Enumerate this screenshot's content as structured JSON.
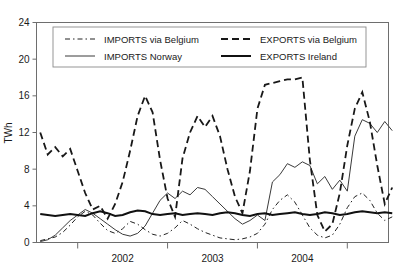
{
  "chart_data": {
    "type": "line",
    "title": "",
    "xlabel": "",
    "ylabel": "TWh",
    "ylim": [
      0,
      24
    ],
    "yticks": [
      0,
      4,
      8,
      12,
      16,
      20,
      24
    ],
    "ytick_labels": [
      "0",
      "4",
      "8",
      "12",
      "16",
      "20",
      "24"
    ],
    "xlim": [
      0,
      47
    ],
    "xtick_positions": [
      5.5,
      17.5,
      29.5,
      41.5
    ],
    "xtick_labels": [
      "2002",
      "2003",
      "2004"
    ],
    "xtick_label_positions": [
      11.5,
      23.5,
      35.5
    ],
    "grid": false,
    "legend_position": "upper-left-inside",
    "series": [
      {
        "name": "IMPORTS via Belgium",
        "style": "dashed-thin",
        "color": "#222222",
        "width": 1.0,
        "dash": "5,3,1.5,3",
        "values": [
          0.2,
          0.4,
          0.6,
          1.1,
          1.9,
          2.8,
          3.4,
          3.0,
          2.1,
          1.3,
          1.0,
          1.5,
          2.3,
          2.0,
          1.4,
          0.9,
          0.7,
          1.0,
          1.6,
          2.4,
          2.0,
          1.5,
          1.1,
          0.8,
          0.5,
          0.4,
          0.3,
          0.4,
          0.6,
          1.0,
          2.0,
          3.6,
          4.6,
          5.2,
          4.4,
          3.0,
          1.6,
          0.8,
          0.5,
          0.8,
          2.0,
          3.8,
          5.0,
          5.4,
          4.6,
          3.2,
          2.4,
          2.8
        ]
      },
      {
        "name": "IMPORTS Norway",
        "style": "solid-thin",
        "color": "#3a3a3a",
        "width": 1.0,
        "dash": "",
        "values": [
          0.1,
          0.3,
          0.8,
          1.6,
          2.4,
          3.0,
          3.6,
          3.2,
          2.6,
          2.0,
          1.4,
          0.9,
          0.7,
          1.0,
          1.8,
          3.2,
          4.6,
          5.4,
          4.8,
          5.6,
          5.2,
          6.0,
          5.8,
          5.0,
          4.2,
          3.4,
          2.6,
          2.0,
          2.4,
          3.0,
          2.4,
          6.6,
          7.4,
          8.6,
          8.2,
          8.8,
          8.4,
          6.4,
          7.2,
          5.8,
          6.8,
          5.6,
          11.6,
          13.4,
          13.0,
          12.0,
          13.2,
          12.2
        ]
      },
      {
        "name": "EXPORTS via Belgium",
        "style": "dashed-thick",
        "color": "#181818",
        "width": 1.8,
        "dash": "7,4",
        "values": [
          12.0,
          9.6,
          10.4,
          9.4,
          10.2,
          7.8,
          5.4,
          3.6,
          4.0,
          2.6,
          4.2,
          6.6,
          10.0,
          13.8,
          16.0,
          14.2,
          9.0,
          4.8,
          2.8,
          9.2,
          12.0,
          13.8,
          12.6,
          13.8,
          11.6,
          8.0,
          5.0,
          3.2,
          7.8,
          14.6,
          17.2,
          17.4,
          17.6,
          17.8,
          17.8,
          18.0,
          9.0,
          3.0,
          1.2,
          2.0,
          5.4,
          10.6,
          14.6,
          16.4,
          13.2,
          8.4,
          4.2,
          6.0
        ]
      },
      {
        "name": "EXPORTS Ireland",
        "style": "solid-thick",
        "color": "#111111",
        "width": 2.0,
        "dash": "",
        "values": [
          3.1,
          3.0,
          2.9,
          3.0,
          3.1,
          3.0,
          2.9,
          3.2,
          3.4,
          3.2,
          2.9,
          3.0,
          3.3,
          3.5,
          3.4,
          3.1,
          3.0,
          3.1,
          3.2,
          3.0,
          3.1,
          3.2,
          3.1,
          3.0,
          3.2,
          3.3,
          3.2,
          3.0,
          2.9,
          3.1,
          3.2,
          3.0,
          3.1,
          3.2,
          3.3,
          3.1,
          3.0,
          3.1,
          3.3,
          3.2,
          3.0,
          3.1,
          3.3,
          3.4,
          3.3,
          3.2,
          3.3,
          3.2
        ]
      }
    ],
    "legend": [
      {
        "label": "IMPORTS via Belgium",
        "style": "dashed-thin"
      },
      {
        "label": "EXPORTS via Belgium",
        "style": "dashed-thick"
      },
      {
        "label": "IMPORTS Norway",
        "style": "solid-thin"
      },
      {
        "label": "EXPORTS Ireland",
        "style": "solid-thick"
      }
    ]
  }
}
